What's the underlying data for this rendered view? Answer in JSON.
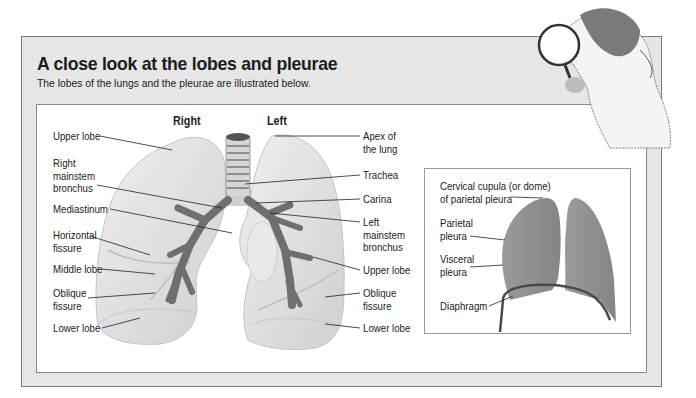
{
  "header": {
    "title": "A close look at the lobes and pleurae",
    "subtitle": "The lobes of the lungs and the pleurae are illustrated below."
  },
  "lungs_diagram": {
    "side_labels": {
      "right": "Right",
      "left": "Left"
    },
    "left_labels": [
      "Upper lobe",
      "Right\nmainstem\nbronchus",
      "Mediastinum",
      "Horizontal\nfissure",
      "Middle lobe",
      "Oblique\nfissure",
      "Lower lobe"
    ],
    "right_labels": [
      "Apex of\nthe lung",
      "Trachea",
      "Carina",
      "Left\nmainstem\nbronchus",
      "Upper lobe",
      "Oblique\nfissure",
      "Lower lobe"
    ]
  },
  "pleura_diagram": {
    "labels": [
      "Cervical cupula (or dome)\nof parietal pleura",
      "Parietal\npleura",
      "Visceral\npleura",
      "Diaphragm"
    ]
  },
  "illustration": {
    "icon": "magnifying-glass-person-icon"
  },
  "colors": {
    "frame_bg": "#e6e6e6",
    "frame_border": "#7a7a7a",
    "lung_fill": "#e2e2e2",
    "bronchus": "#6f6f6f",
    "pleura_fill": "#8e8e8e",
    "diaphragm": "#4a4a4a"
  }
}
